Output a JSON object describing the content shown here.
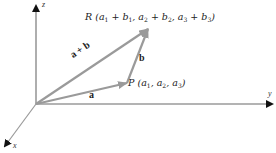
{
  "diagram": {
    "type": "3d-vector-addition",
    "colors": {
      "axis": "#9a9a9a",
      "vector": "#9a9a9a",
      "arrowhead": "#111111",
      "text": "#222222"
    },
    "axes": {
      "z": {
        "label": "z"
      },
      "y": {
        "label": "y"
      },
      "x": {
        "label": "x"
      }
    },
    "vectors": [
      {
        "id": "a",
        "label": "a",
        "from": "origin",
        "to": "P"
      },
      {
        "id": "b",
        "label": "b",
        "from": "P",
        "to": "R"
      },
      {
        "id": "a_plus_b",
        "label": "a + b",
        "from": "origin",
        "to": "R"
      }
    ],
    "points": {
      "P": {
        "name": "P",
        "coords": "(a1, a2, a3)"
      },
      "R": {
        "name": "R",
        "coords": "(a1 + b1, a2 + b2, a3 + b3)"
      }
    }
  }
}
